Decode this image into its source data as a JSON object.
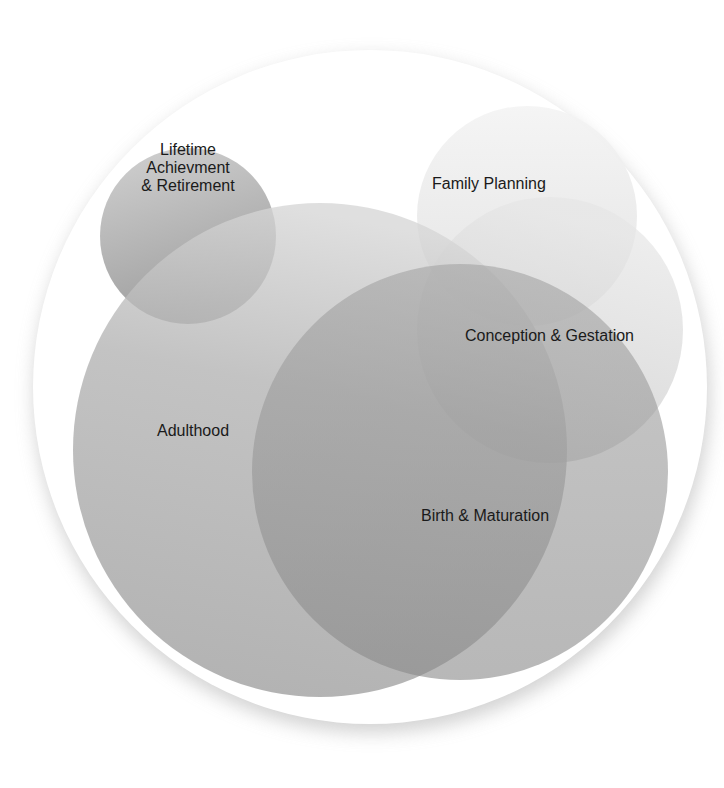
{
  "diagram": {
    "type": "overlapping-circles (venn-style life cycle)",
    "circles": [
      {
        "id": "lifetime",
        "label_lines": [
          "Lifetime",
          "Achievment",
          "& Retirement"
        ],
        "cx": 188,
        "cy": 236,
        "r": 88,
        "color_top": "#cfcfcf",
        "color_bottom": "#9a9a9a",
        "opacity": 0.85
      },
      {
        "id": "family",
        "label_lines": [
          "Family Planning"
        ],
        "cx": 527,
        "cy": 216,
        "r": 110,
        "color_top": "#f4f4f4",
        "color_bottom": "#e2e2e2",
        "opacity": 0.9
      },
      {
        "id": "conception",
        "label_lines": [
          "Conception & Gestation"
        ],
        "cx": 550,
        "cy": 330,
        "r": 133,
        "color_top": "#e2e2e2",
        "color_bottom": "#c6c6c6",
        "opacity": 0.75
      },
      {
        "id": "adulthood",
        "label_lines": [
          "Adulthood"
        ],
        "cx": 320,
        "cy": 450,
        "r": 247,
        "color_top": "#cdcdcd",
        "color_bottom": "#9e9e9e",
        "opacity": 0.8
      },
      {
        "id": "birth",
        "label_lines": [
          "Birth & Maturation"
        ],
        "cx": 460,
        "cy": 472,
        "r": 208,
        "color_top": "#9a9a9a",
        "color_bottom": "#828282",
        "opacity": 0.62
      }
    ],
    "outer_circle": {
      "cx": 370,
      "cy": 387,
      "r": 337,
      "fill": "#ffffff",
      "shadow": "#bdbdbd"
    },
    "labels": {
      "lifetime": [
        "Lifetime",
        "Achievment",
        "& Retirement"
      ],
      "family": "Family Planning",
      "conception": "Conception & Gestation",
      "adulthood": "Adulthood",
      "birth": "Birth & Maturation"
    },
    "text_color": "#1a1a1a"
  }
}
